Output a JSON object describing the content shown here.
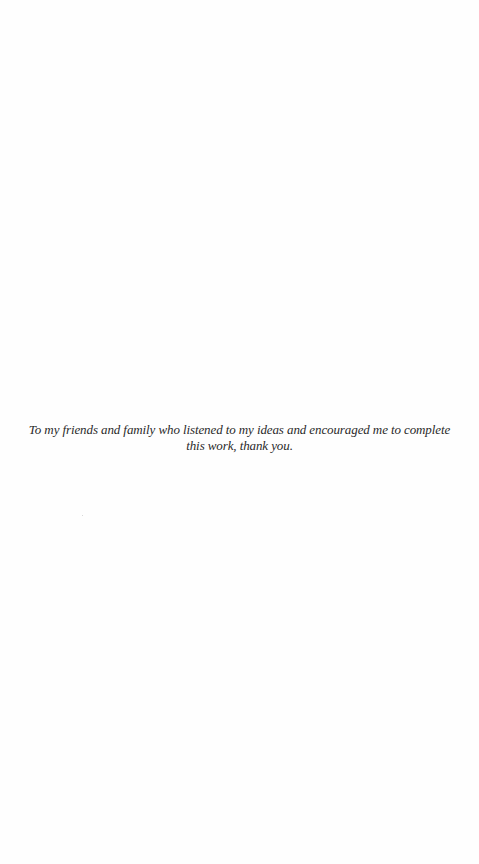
{
  "page": {
    "type": "dedication",
    "dedication_text": "To my friends and family who listened to my ideas and encouraged me to complete this work, thank you."
  }
}
